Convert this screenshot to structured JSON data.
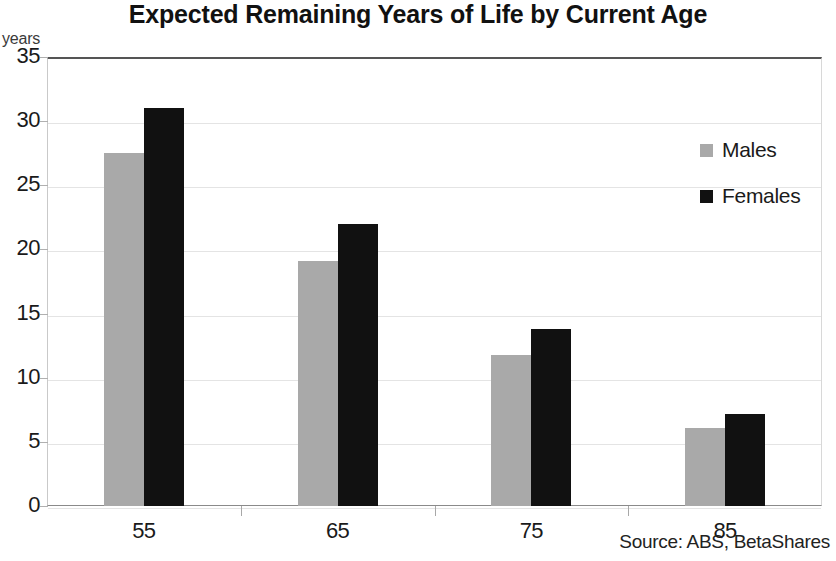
{
  "chart_data": {
    "type": "bar",
    "title": "Expected Remaining Years of Life by Current Age",
    "xlabel": "",
    "ylabel": "years",
    "categories": [
      "55",
      "65",
      "75",
      "85"
    ],
    "series": [
      {
        "name": "Males",
        "color": "#a9a9a9",
        "values": [
          27.5,
          19.1,
          11.8,
          6.1
        ]
      },
      {
        "name": "Females",
        "color": "#111111",
        "values": [
          31.0,
          22.0,
          13.8,
          7.2
        ]
      }
    ],
    "ylim": [
      0,
      35
    ],
    "y_ticks": [
      "0",
      "5",
      "10",
      "15",
      "20",
      "25",
      "30",
      "35"
    ],
    "grid": true,
    "legend_position": "inside-top-right",
    "source_note": "Source: ABS, BetaShares"
  },
  "legend": {
    "entries": [
      {
        "label": "Males",
        "swatch": "legend-swatch-males"
      },
      {
        "label": "Females",
        "swatch": "legend-swatch-females"
      }
    ]
  }
}
